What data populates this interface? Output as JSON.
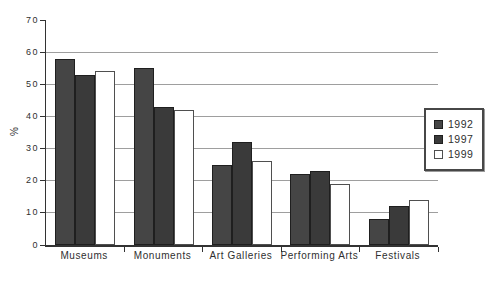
{
  "chart_data": {
    "type": "bar",
    "title": "",
    "xlabel": "",
    "ylabel": "%",
    "ylim": [
      0,
      70
    ],
    "yticks": [
      0,
      10,
      20,
      30,
      40,
      50,
      60,
      70
    ],
    "gridlines": [
      10,
      20,
      30,
      40,
      50,
      60
    ],
    "grid": "horizontal",
    "categories": [
      "Museums",
      "Monuments",
      "Art Galleries",
      "Performing Arts",
      "Festivals"
    ],
    "series": [
      {
        "name": "1992",
        "values": [
          58,
          55,
          25,
          22,
          8
        ],
        "color": "#454545",
        "outline": "#1f1f1f",
        "style": "solid"
      },
      {
        "name": "1997",
        "values": [
          53,
          43,
          32,
          23,
          12
        ],
        "color": "#3a3a3a",
        "outline": "#1f1f1f",
        "style": "solid"
      },
      {
        "name": "1999",
        "values": [
          54,
          42,
          26,
          19,
          14
        ],
        "color": "#ffffff",
        "outline": "#4f4f4f",
        "style": "open"
      }
    ],
    "legend": {
      "position": "right",
      "entries": [
        "1992",
        "1997",
        "1999"
      ]
    },
    "colors": {
      "background": "#ffffff",
      "gridline": "#9e9e9e",
      "axis": "#333333",
      "text": "#2f2f2f"
    }
  }
}
